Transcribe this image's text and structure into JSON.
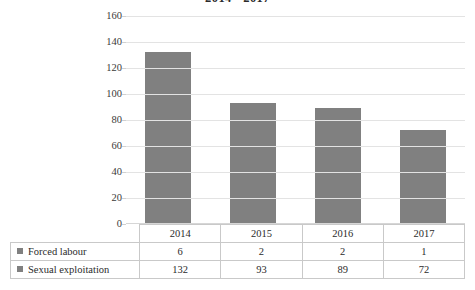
{
  "chart_data": {
    "type": "bar",
    "title": "2014 - 2017",
    "xlabel": "",
    "ylabel": "",
    "ylim": [
      0,
      160
    ],
    "ytick_step": 20,
    "grid": true,
    "legend_position": "table-left",
    "categories": [
      "2014",
      "2015",
      "2016",
      "2017"
    ],
    "series": [
      {
        "name": "Forced labour",
        "values": [
          6,
          2,
          2,
          1
        ],
        "color": "#808080"
      },
      {
        "name": "Sexual exploitation",
        "values": [
          132,
          93,
          89,
          72
        ],
        "color": "#808080"
      }
    ],
    "plotted_series": "Sexual exploitation",
    "yticks": [
      "160",
      "140",
      "120",
      "100",
      "80",
      "60",
      "40",
      "20",
      "0"
    ]
  },
  "table": {
    "corner": "",
    "header": [
      "2014",
      "2015",
      "2016",
      "2017"
    ],
    "rows": [
      {
        "label": "Forced labour",
        "values": [
          "6",
          "2",
          "2",
          "1"
        ]
      },
      {
        "label": "Sexual exploitation",
        "values": [
          "132",
          "93",
          "89",
          "72"
        ]
      }
    ]
  },
  "colors": {
    "bar": "#808080",
    "gridline": "#e3e3e3",
    "table_border": "#c9c9c9",
    "text": "#2b2b2b",
    "background": "#ffffff"
  }
}
